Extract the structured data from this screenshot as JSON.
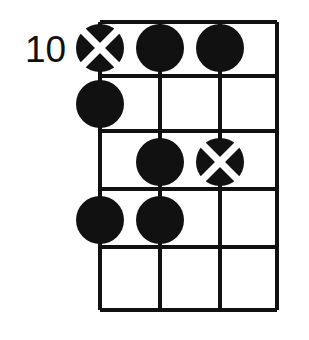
{
  "diagram": {
    "kind": "guitar-chord-fretboard-diagram",
    "title": "",
    "position_label": "10",
    "colors": {
      "background": "#ffffff",
      "grid_line": "#111111",
      "dot_fill": "#111111",
      "marker_cross": "#ffffff"
    },
    "grid": {
      "strings": 4,
      "string_x": [
        100,
        160,
        220,
        277
      ],
      "frets": 5,
      "fret_y": [
        22,
        76,
        131,
        189,
        247,
        310
      ],
      "line_width": 4
    },
    "markers": [
      {
        "id": "m1",
        "label": "root-marker",
        "type": "cross-dot",
        "string": 1,
        "fret": 1,
        "cx": 100,
        "cy": 48,
        "r": 24
      },
      {
        "id": "m2",
        "label": "finger-dot",
        "type": "filled-dot",
        "string": 2,
        "fret": 1,
        "cx": 160,
        "cy": 48,
        "r": 24
      },
      {
        "id": "m3",
        "label": "finger-dot",
        "type": "filled-dot",
        "string": 3,
        "fret": 1,
        "cx": 220,
        "cy": 48,
        "r": 24
      },
      {
        "id": "m4",
        "label": "finger-dot",
        "type": "filled-dot",
        "string": 1,
        "fret": 2,
        "cx": 100,
        "cy": 104,
        "r": 24
      },
      {
        "id": "m5",
        "label": "finger-dot",
        "type": "filled-dot",
        "string": 2,
        "fret": 3,
        "cx": 160,
        "cy": 162,
        "r": 24
      },
      {
        "id": "m6",
        "label": "root-marker",
        "type": "cross-dot",
        "string": 3,
        "fret": 3,
        "cx": 220,
        "cy": 162,
        "r": 24
      },
      {
        "id": "m7",
        "label": "finger-dot",
        "type": "filled-dot",
        "string": 1,
        "fret": 4,
        "cx": 100,
        "cy": 220,
        "r": 24
      },
      {
        "id": "m8",
        "label": "finger-dot",
        "type": "filled-dot",
        "string": 2,
        "fret": 4,
        "cx": 160,
        "cy": 220,
        "r": 24
      }
    ],
    "fret_number": {
      "text": "10",
      "x": 25,
      "y": 62
    }
  }
}
